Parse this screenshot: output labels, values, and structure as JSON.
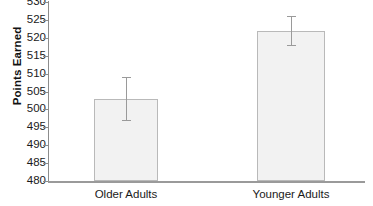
{
  "chart_data": {
    "type": "bar",
    "title": "",
    "xlabel": "",
    "ylabel": "Points Earned",
    "categories": [
      "Older Adults",
      "Younger Adults"
    ],
    "values": [
      503,
      522
    ],
    "errors_low": [
      497,
      518
    ],
    "errors_high": [
      509,
      526
    ],
    "ylim": [
      480,
      530
    ],
    "ytick_labels": [
      "530",
      "525",
      "520",
      "515",
      "510",
      "505",
      "500",
      "495",
      "490",
      "485",
      "480"
    ],
    "ytick_values": [
      530,
      525,
      520,
      515,
      510,
      505,
      500,
      495,
      490,
      485,
      480
    ],
    "ytick_step": 5,
    "grid": false,
    "legend": false,
    "bar_fill_color": "#f2f2f2",
    "bar_edge_color": "#b9b9b9",
    "axis_color": "#9a9a9a",
    "text_color": "#1a1a1a"
  }
}
